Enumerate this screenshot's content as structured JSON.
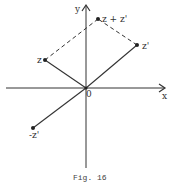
{
  "diagram": {
    "caption": "Fig. 16",
    "axes": {
      "x_label": "x",
      "y_label": "y",
      "origin_label": "0"
    },
    "points": {
      "z": {
        "label": "z"
      },
      "z_prime": {
        "label": "z'"
      },
      "z_sum": {
        "label": "z + z'"
      },
      "neg_z_prime": {
        "label": "-z'"
      }
    },
    "colors": {
      "line": "#333333",
      "background": "#ffffff"
    }
  }
}
